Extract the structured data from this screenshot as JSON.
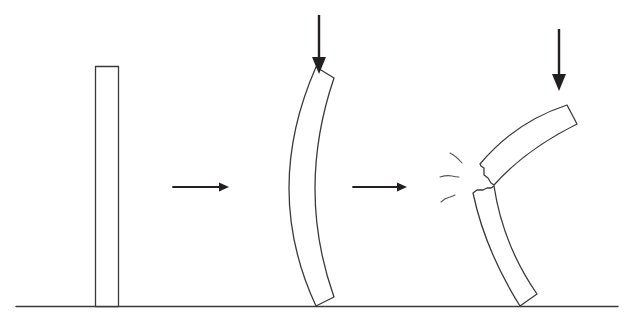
{
  "diagram": {
    "title": "Column buckling under axial load",
    "stages": [
      {
        "id": "straight",
        "label": "Straight column (unloaded)"
      },
      {
        "id": "buckled",
        "label": "Buckled column under load"
      },
      {
        "id": "fractured",
        "label": "Fractured column"
      }
    ],
    "transitions": [
      {
        "from": "straight",
        "to": "buckled",
        "icon": "right-arrow-icon"
      },
      {
        "from": "buckled",
        "to": "fractured",
        "icon": "right-arrow-icon"
      }
    ],
    "loads": [
      {
        "stage": "buckled",
        "icon": "down-arrow-icon",
        "direction": "down"
      },
      {
        "stage": "fractured",
        "icon": "down-arrow-icon",
        "direction": "down"
      }
    ],
    "colors": {
      "background": "#ffffff",
      "outline": "#3a3a3a",
      "arrow": "#231f1e"
    }
  }
}
